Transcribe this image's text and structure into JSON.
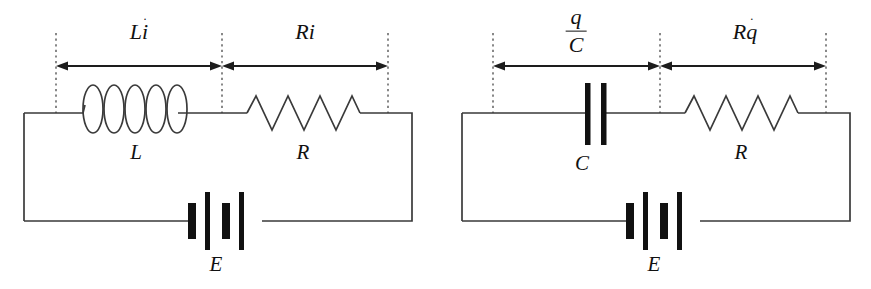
{
  "figure": {
    "background_color": "#ffffff",
    "line_color": "#3a3a3a",
    "text_color": "#111111",
    "fill_color": "#111111"
  },
  "circuits": [
    {
      "id": "left-circuit",
      "name": "LR circuit with inductor, resistor and battery",
      "span_labels": [
        {
          "id": "left-span-inductor",
          "text": "Li",
          "base": "L",
          "variable": "i",
          "has_dot": true,
          "dot_glyph": "˙",
          "meaning": "L i-dot"
        },
        {
          "id": "left-span-resistor",
          "text": "Ri",
          "base": "R",
          "variable": "i",
          "has_dot": false,
          "dot_glyph": "",
          "meaning": "R i"
        }
      ],
      "components": [
        {
          "id": "inductor",
          "label": "L",
          "type": "inductor",
          "coil_count": 5
        },
        {
          "id": "resistor",
          "label": "R",
          "type": "resistor",
          "zigzag_peaks": 3
        },
        {
          "id": "battery",
          "label": "E",
          "type": "battery",
          "plate_count": 4
        }
      ]
    },
    {
      "id": "right-circuit",
      "name": "RC circuit with capacitor, resistor and battery",
      "span_labels": [
        {
          "id": "right-span-capacitor",
          "text": "q/C",
          "numerator": "q",
          "denominator": "C",
          "is_fraction": true,
          "meaning": "q over C"
        },
        {
          "id": "right-span-resistor",
          "text": "Rq",
          "base": "R",
          "variable": "q",
          "has_dot": true,
          "dot_glyph": "˙",
          "meaning": "R q-dot"
        }
      ],
      "components": [
        {
          "id": "capacitor",
          "label": "C",
          "type": "capacitor",
          "plate_count": 2
        },
        {
          "id": "resistor",
          "label": "R",
          "type": "resistor",
          "zigzag_peaks": 3
        },
        {
          "id": "battery",
          "label": "E",
          "type": "battery",
          "plate_count": 4
        }
      ]
    }
  ]
}
